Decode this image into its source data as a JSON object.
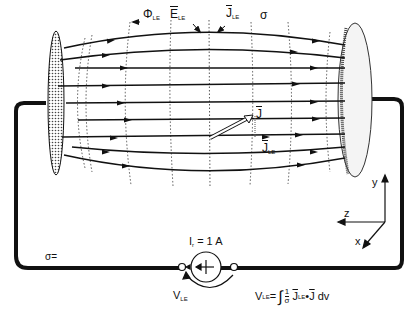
{
  "diagram": {
    "type": "lead-field volume conductor",
    "labels": {
      "phi": "Φ",
      "phi_sub": "LE",
      "e": "E",
      "e_sub": "LE",
      "j_top": "J",
      "j_top_sub": "LE",
      "sigma_top": "σ",
      "j_vec": "J",
      "jle": "J",
      "jle_sub": "LE",
      "sigma_bottom": "σ=",
      "current": "I",
      "current_sub": "r",
      "current_value": "= 1 A",
      "vle": "V",
      "vle_sub": "LE",
      "formula_lhs": "V",
      "formula_lhs_sub": "LE",
      "formula_eq": "=",
      "formula_integral": "∫",
      "formula_frac_num": "1",
      "formula_frac_den": "σ",
      "formula_j1": "J",
      "formula_j1_sub": "LE",
      "formula_dot": "•",
      "formula_j2": "J",
      "formula_dv": "dv"
    },
    "axes": {
      "y": "y",
      "z": "z",
      "x": "x"
    },
    "colors": {
      "line": "#111111",
      "background": "#ffffff",
      "dotted": "#555555"
    }
  }
}
